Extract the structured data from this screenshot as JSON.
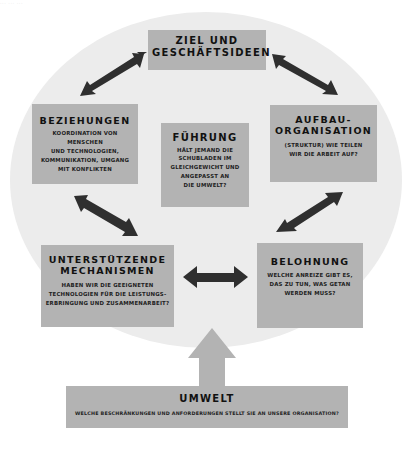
{
  "page_header_fragment": "··· ··· ···",
  "colors": {
    "box_fill": "#b3b3b3",
    "background_circle": "#ececec",
    "arrow_dark": "#2f2f2f",
    "arrow_light": "#b3b3b3",
    "text": "#111111"
  },
  "center": {
    "title": "FÜHRUNG",
    "lines": [
      "HÄLT JEMAND DIE",
      "SCHUBLADEN IM",
      "GLEICHGEWICHT UND",
      "ANGEPASST AN",
      "DIE UMWELT?"
    ]
  },
  "boxes": {
    "goal": {
      "title_lines": [
        "ZIEL UND",
        "GESCHÄFTSIDEEN"
      ]
    },
    "relationships": {
      "title": "BEZIEHUNGEN",
      "lines": [
        "KOORDINATION VON MENSCHEN",
        "UND TECHNOLOGIEN,",
        "KOMMUNIKATION, UMGANG",
        "MIT KONFLIKTEN"
      ]
    },
    "structure": {
      "title_lines": [
        "AUFBAU-",
        "ORGANISATION"
      ],
      "lines": [
        "(STRUKTUR) WIE TEILEN",
        "WIR DIE ARBEIT AUF?"
      ]
    },
    "mechanisms": {
      "title_lines": [
        "UNTERSTÜTZENDE",
        "MECHANISMEN"
      ],
      "lines": [
        "HABEN WIR DIE GEEIGNETEN",
        "TECHNOLOGIEN FÜR DIE LEISTUNGS-",
        "ERBRINGUNG UND ZUSAMMENARBEIT?"
      ]
    },
    "rewards": {
      "title": "BELOHNUNG",
      "lines": [
        "WELCHE ANREIZE GIBT ES,",
        "DAS ZU TUN, WAS GETAN",
        "WERDEN MUSS?"
      ]
    },
    "environment": {
      "title": "UMWELT",
      "text": "WELCHE BESCHRÄNKUNGEN UND ANFORDERUNGEN STELLT SIE AN UNSERE ORGANISATION?"
    }
  },
  "arrows": [
    {
      "name": "goal-relationships",
      "type": "bidirectional"
    },
    {
      "name": "goal-structure",
      "type": "bidirectional"
    },
    {
      "name": "relationships-mechanisms",
      "type": "bidirectional"
    },
    {
      "name": "structure-rewards",
      "type": "bidirectional"
    },
    {
      "name": "mechanisms-rewards",
      "type": "bidirectional"
    },
    {
      "name": "environment-to-organisation",
      "type": "up"
    }
  ]
}
